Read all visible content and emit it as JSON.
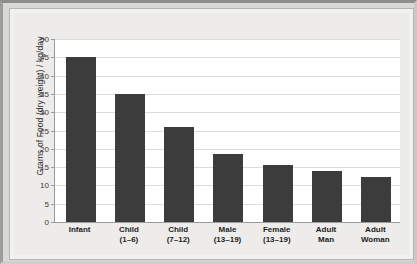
{
  "chart_data": {
    "type": "bar",
    "title": "",
    "xlabel": "",
    "ylabel": "Grams of Food (dry weight) / kg/day",
    "ylim": [
      0,
      50
    ],
    "yticks": [
      0,
      5,
      10,
      15,
      20,
      25,
      30,
      35,
      40,
      45,
      50
    ],
    "ytick_labels": [
      "0",
      "5",
      "10",
      "15",
      "20",
      "25",
      "30",
      "35",
      "40",
      "45",
      "50"
    ],
    "grid": true,
    "legend": "none",
    "bar_color": "#3c3c3c",
    "plot_background": "#ffffff",
    "panel_background": "#edecea",
    "categories": [
      "Infant",
      "Child (1–6)",
      "Child (7–12)",
      "Male (13–19)",
      "Female (13–19)",
      "Adult Man",
      "Adult Woman"
    ],
    "category_lines": [
      {
        "line1": "Infant",
        "line2": ""
      },
      {
        "line1": "Child",
        "line2": "(1–6)"
      },
      {
        "line1": "Child",
        "line2": "(7–12)"
      },
      {
        "line1": "Male",
        "line2": "(13–19)"
      },
      {
        "line1": "Female",
        "line2": "(13–19)"
      },
      {
        "line1": "Adult",
        "line2": "Man"
      },
      {
        "line1": "Adult",
        "line2": "Woman"
      }
    ],
    "values": [
      45,
      35,
      26,
      18.5,
      15.5,
      14,
      12.3
    ]
  }
}
